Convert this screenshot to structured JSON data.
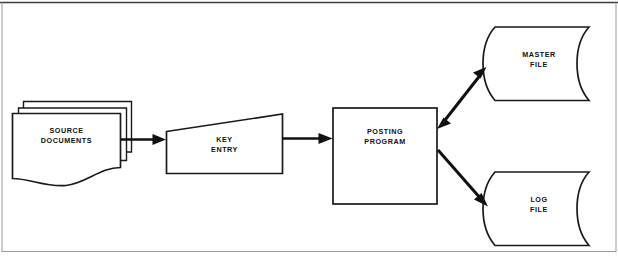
{
  "diagram": {
    "type": "flowchart",
    "background_color": "#ffffff",
    "line_color": "#111111",
    "nodes": [
      {
        "id": "source-documents",
        "label_line1": "SOURCE",
        "label_line2": "DOCUMENTS",
        "symbol": "multiple-documents",
        "symbol_name": "document-stack-icon"
      },
      {
        "id": "key-entry",
        "label_line1": "KEY",
        "label_line2": "ENTRY",
        "symbol": "manual-input",
        "symbol_name": "manual-input-icon"
      },
      {
        "id": "posting-program",
        "label_line1": "POSTING",
        "label_line2": "PROGRAM",
        "symbol": "process",
        "symbol_name": "process-box-icon"
      },
      {
        "id": "master-file",
        "label_line1": "MASTER",
        "label_line2": "FILE",
        "symbol": "direct-access-storage",
        "symbol_name": "disk-storage-icon"
      },
      {
        "id": "log-file",
        "label_line1": "LOG",
        "label_line2": "FILE",
        "symbol": "direct-access-storage",
        "symbol_name": "disk-storage-icon"
      }
    ],
    "edges": [
      {
        "id": "edge-source-to-key-entry",
        "from": "source-documents",
        "to": "key-entry",
        "direction": "one-way",
        "orientation": "horizontal"
      },
      {
        "id": "edge-key-entry-to-posting",
        "from": "key-entry",
        "to": "posting-program",
        "direction": "one-way",
        "orientation": "horizontal"
      },
      {
        "id": "edge-posting-to-master",
        "from": "posting-program",
        "to": "master-file",
        "direction": "two-way",
        "orientation": "diagonal-up"
      },
      {
        "id": "edge-posting-to-log",
        "from": "posting-program",
        "to": "log-file",
        "direction": "one-way",
        "orientation": "diagonal-down"
      }
    ]
  }
}
